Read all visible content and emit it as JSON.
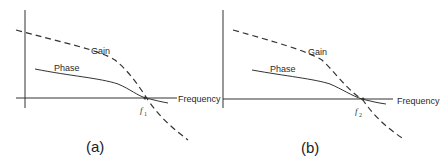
{
  "panels": [
    {
      "caption": "(a)",
      "gain_label": "Gain",
      "phase_label": "Phase",
      "x_axis_label": "Frequency",
      "crossover_label": "f",
      "crossover_subscript": "1"
    },
    {
      "caption": "(b)",
      "gain_label": "Gain",
      "phase_label": "Phase",
      "x_axis_label": "Frequency",
      "crossover_label": "f",
      "crossover_subscript": "2"
    }
  ],
  "colors": {
    "line": "#2a2a2a",
    "background": "#ffffff"
  }
}
